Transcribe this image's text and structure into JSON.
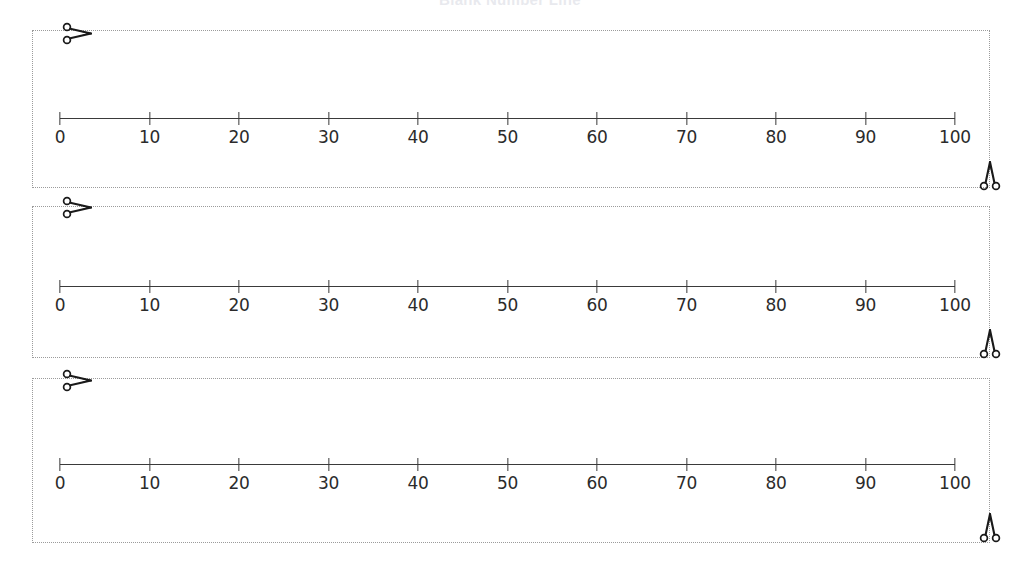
{
  "worksheet": {
    "title": "Blank Number Line",
    "strip_count": 3
  },
  "chart_data": {
    "type": "line",
    "title": "Blank Number Line",
    "xlabel": "",
    "ylabel": "",
    "xlim": [
      0,
      100
    ],
    "grid": false,
    "legend": "none",
    "tick_interval": 10,
    "tick_labels": [
      "0",
      "10",
      "20",
      "30",
      "40",
      "50",
      "60",
      "70",
      "80",
      "90",
      "100"
    ],
    "tick_values": [
      0,
      10,
      20,
      30,
      40,
      50,
      60,
      70,
      80,
      90,
      100
    ],
    "series": [
      {
        "name": "number-line-1",
        "values": []
      },
      {
        "name": "number-line-2",
        "values": []
      },
      {
        "name": "number-line-3",
        "values": []
      }
    ],
    "axis_color": "#3a3a3a",
    "border_color": "#9b9b9b"
  },
  "strips": [
    {
      "id": "strip-1",
      "cut_hint": "scissors",
      "label": "Number line strip 1"
    },
    {
      "id": "strip-2",
      "cut_hint": "scissors",
      "label": "Number line strip 2"
    },
    {
      "id": "strip-3",
      "cut_hint": "scissors",
      "label": "Number line strip 3"
    }
  ],
  "icons": {
    "scissors_top_left": "scissors-icon",
    "scissors_bottom_right": "scissors-icon"
  }
}
